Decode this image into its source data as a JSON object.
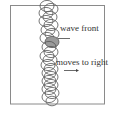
{
  "diagram": {
    "labels": {
      "wave_front": "wave front",
      "moves": "moves to right"
    },
    "colors": {
      "frame": "#8a8a8a",
      "circle_stroke": "#555555",
      "shaded": "#9a9a9a"
    },
    "circles": [
      {
        "cx": 47,
        "cy": 6,
        "r": 7
      },
      {
        "cx": 51,
        "cy": 9,
        "r": 7
      },
      {
        "cx": 46,
        "cy": 13,
        "r": 7
      },
      {
        "cx": 50,
        "cy": 17,
        "r": 7
      },
      {
        "cx": 46,
        "cy": 21,
        "r": 7
      },
      {
        "cx": 51,
        "cy": 25,
        "r": 7
      },
      {
        "cx": 48,
        "cy": 30,
        "r": 7
      },
      {
        "cx": 52,
        "cy": 34,
        "r": 7
      },
      {
        "cx": 47,
        "cy": 38,
        "r": 7
      },
      {
        "cx": 52,
        "cy": 42,
        "r": 7,
        "shaded": true
      },
      {
        "cx": 49,
        "cy": 47,
        "r": 7
      },
      {
        "cx": 51,
        "cy": 52,
        "r": 7
      },
      {
        "cx": 47,
        "cy": 56,
        "r": 7
      },
      {
        "cx": 50,
        "cy": 60,
        "r": 7
      },
      {
        "cx": 48,
        "cy": 65,
        "r": 7
      },
      {
        "cx": 51,
        "cy": 69,
        "r": 7
      },
      {
        "cx": 49,
        "cy": 73,
        "r": 7
      },
      {
        "cx": 51,
        "cy": 77,
        "r": 7
      },
      {
        "cx": 49,
        "cy": 81,
        "r": 7
      },
      {
        "cx": 51,
        "cy": 85,
        "r": 7
      },
      {
        "cx": 49,
        "cy": 89,
        "r": 7
      },
      {
        "cx": 52,
        "cy": 93,
        "r": 7
      },
      {
        "cx": 49,
        "cy": 97,
        "r": 7
      },
      {
        "cx": 52,
        "cy": 101,
        "r": 6
      }
    ]
  }
}
